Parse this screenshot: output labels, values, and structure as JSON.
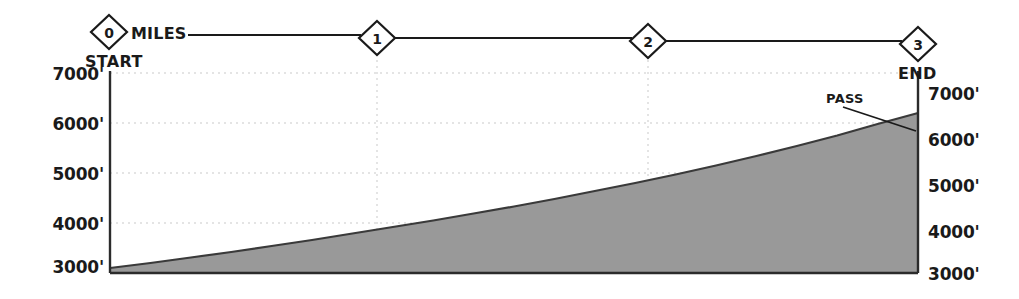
{
  "chart_data": {
    "type": "area",
    "title": "",
    "subtitle": "",
    "xlabel": "MILES",
    "ylabel": "",
    "xlim": [
      0,
      3
    ],
    "ylim": [
      3000,
      7000
    ],
    "grid": true,
    "legend_position": "none",
    "x_tick_labels": [
      "0",
      "1",
      "2",
      "3"
    ],
    "x_tick_values": [
      0,
      1,
      2,
      3
    ],
    "y_tick_labels_left": [
      "7000'",
      "6000'",
      "5000'",
      "4000'",
      "3000'"
    ],
    "y_tick_labels_right": [
      "7000'",
      "6000'",
      "5000'",
      "4000'",
      "3000'"
    ],
    "y_tick_values": [
      7000,
      6000,
      5000,
      4000,
      3000
    ],
    "series": [
      {
        "name": "elevation",
        "x": [
          0.0,
          0.15,
          0.3,
          0.45,
          0.6,
          0.75,
          0.9,
          1.05,
          1.2,
          1.35,
          1.5,
          1.65,
          1.8,
          1.95,
          2.1,
          2.25,
          2.4,
          2.55,
          2.7,
          2.85,
          3.0
        ],
        "values": [
          3100,
          3200,
          3310,
          3420,
          3540,
          3660,
          3790,
          3920,
          4050,
          4190,
          4330,
          4480,
          4640,
          4800,
          4970,
          5150,
          5340,
          5540,
          5750,
          5980,
          6200
        ]
      }
    ],
    "annotations": [
      {
        "name": "pass",
        "label": "PASS",
        "x": 2.72,
        "y": 6650,
        "points_to_x": 3.0,
        "points_to_y": 6200
      },
      {
        "name": "start",
        "label": "START",
        "x": 0,
        "y": 3100
      },
      {
        "name": "end",
        "label": "END",
        "x": 3,
        "y": 6200
      }
    ],
    "colors": {
      "fill": "#999999",
      "outline": "#3a3a3a",
      "axis": "#2b2b2b",
      "grid": "#c9c9c9",
      "text": "#1a1a1a",
      "background": "#ffffff"
    }
  },
  "scale_bar": {
    "unit_label": "MILES",
    "markers": [
      {
        "label": "0",
        "name": "mile-marker-0"
      },
      {
        "label": "1",
        "name": "mile-marker-1"
      },
      {
        "label": "2",
        "name": "mile-marker-2"
      },
      {
        "label": "3",
        "name": "mile-marker-3"
      }
    ]
  },
  "endpoints": {
    "start_label": "START",
    "end_label": "END"
  },
  "axis": {
    "left_ticks": [
      "7000'",
      "6000'",
      "5000'",
      "4000'",
      "3000'"
    ],
    "right_ticks": [
      "7000'",
      "6000'",
      "5000'",
      "4000'",
      "3000'"
    ]
  },
  "annotation": {
    "pass_label": "PASS"
  }
}
